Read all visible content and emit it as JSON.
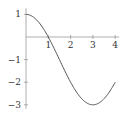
{
  "chart_data": {
    "type": "line",
    "title": "",
    "xlabel": "",
    "ylabel": "",
    "function": "f(x) = 2cos(pi x / 3) - 1",
    "xlim": [
      0,
      4
    ],
    "ylim": [
      -3,
      1
    ],
    "grid": false,
    "x_ticks": [
      1,
      2,
      3,
      4
    ],
    "x_tick_labels": [
      "1",
      "2",
      "3",
      "4"
    ],
    "y_ticks": [
      1,
      -1,
      -2,
      -3
    ],
    "y_tick_labels": [
      "1",
      "−1",
      "−2",
      "−3"
    ],
    "series": [
      {
        "name": "f",
        "x": [
          0,
          0.5,
          1,
          1.5,
          2,
          2.5,
          3,
          3.5,
          4
        ],
        "y": [
          1,
          0.732,
          0,
          -1,
          -2,
          -2.732,
          -3,
          -2.732,
          -2
        ],
        "color": "#555555"
      }
    ]
  }
}
